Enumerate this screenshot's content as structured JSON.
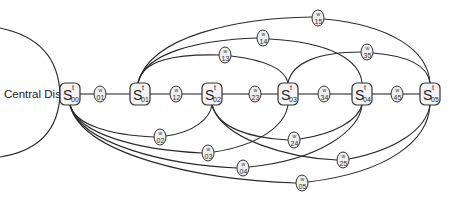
{
  "central_disc": {
    "label": "Central Disc"
  },
  "s_nodes": [
    {
      "id": "S00",
      "base": "S",
      "sup": "t",
      "sub": "00",
      "x": 70,
      "y": 94
    },
    {
      "id": "S01",
      "base": "S",
      "sup": "t",
      "sub": "01",
      "x": 140,
      "y": 94
    },
    {
      "id": "S02",
      "base": "S",
      "sup": "t",
      "sub": "02",
      "x": 212,
      "y": 94
    },
    {
      "id": "S03",
      "base": "S",
      "sup": "t",
      "sub": "03",
      "x": 288,
      "y": 94
    },
    {
      "id": "S04",
      "base": "S",
      "sup": "t",
      "sub": "04",
      "x": 362,
      "y": 94
    },
    {
      "id": "S05",
      "base": "S",
      "sup": "t",
      "sub": "05",
      "x": 430,
      "y": 94
    }
  ],
  "w_nodes": [
    {
      "id": "w01",
      "top": "w",
      "bot": "01",
      "x": 100,
      "y": 94
    },
    {
      "id": "w12",
      "top": "w",
      "bot": "12",
      "x": 176,
      "y": 94
    },
    {
      "id": "w23",
      "top": "w",
      "bot": "23",
      "x": 255,
      "y": 94
    },
    {
      "id": "w34",
      "top": "w",
      "bot": "34",
      "x": 324,
      "y": 94
    },
    {
      "id": "w45",
      "top": "w",
      "bot": "45",
      "x": 397,
      "y": 94
    },
    {
      "id": "w13",
      "top": "w",
      "bot": "13",
      "x": 225,
      "y": 55
    },
    {
      "id": "w14",
      "top": "w",
      "bot": "14",
      "x": 263,
      "y": 38
    },
    {
      "id": "w15",
      "top": "w",
      "bot": "15",
      "x": 318,
      "y": 18
    },
    {
      "id": "w35",
      "top": "w",
      "bot": "35",
      "x": 367,
      "y": 52
    },
    {
      "id": "w02",
      "top": "w",
      "bot": "02",
      "x": 160,
      "y": 137
    },
    {
      "id": "w03",
      "top": "w",
      "bot": "03",
      "x": 208,
      "y": 153
    },
    {
      "id": "w04",
      "top": "w",
      "bot": "04",
      "x": 243,
      "y": 168
    },
    {
      "id": "w05",
      "top": "w",
      "bot": "05",
      "x": 302,
      "y": 183
    },
    {
      "id": "w24",
      "top": "w",
      "bot": "24",
      "x": 294,
      "y": 140
    },
    {
      "id": "w25",
      "top": "w",
      "bot": "25",
      "x": 343,
      "y": 160
    }
  ],
  "edges": [
    [
      "S00",
      "w01"
    ],
    [
      "w01",
      "S01"
    ],
    [
      "S01",
      "w12"
    ],
    [
      "w12",
      "S02"
    ],
    [
      "S02",
      "w23"
    ],
    [
      "w23",
      "S03"
    ],
    [
      "S03",
      "w34"
    ],
    [
      "w34",
      "S04"
    ],
    [
      "S04",
      "w45"
    ],
    [
      "w45",
      "S05"
    ],
    [
      "S01",
      "w13"
    ],
    [
      "w13",
      "S03"
    ],
    [
      "S01",
      "w14"
    ],
    [
      "w14",
      "S04"
    ],
    [
      "S01",
      "w15"
    ],
    [
      "w15",
      "S05"
    ],
    [
      "S03",
      "w35"
    ],
    [
      "w35",
      "S05"
    ],
    [
      "S00",
      "w02"
    ],
    [
      "w02",
      "S02"
    ],
    [
      "S00",
      "w03"
    ],
    [
      "w03",
      "S03"
    ],
    [
      "S00",
      "w04"
    ],
    [
      "w04",
      "S04"
    ],
    [
      "S00",
      "w05"
    ],
    [
      "w05",
      "S05"
    ],
    [
      "S02",
      "w24"
    ],
    [
      "w24",
      "S04"
    ],
    [
      "S02",
      "w25"
    ],
    [
      "w25",
      "S05"
    ]
  ]
}
